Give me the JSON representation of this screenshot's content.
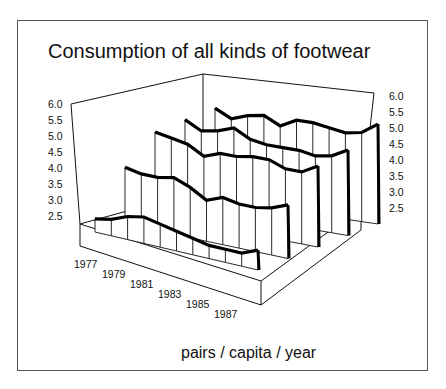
{
  "chart_data": {
    "type": "3d-ribbon-line",
    "title": "Consumption of all kinds of footwear",
    "xlabel": "",
    "ylabel": "pairs / capita / year",
    "y_tick_labels_left": [
      "6.0",
      "5.5",
      "5.0",
      "4.5",
      "4.0",
      "3.5",
      "3.0",
      "2.5"
    ],
    "y_tick_labels_right": [
      "6.0",
      "5.5",
      "5.0",
      "4.5",
      "4.0",
      "3.5",
      "3.0",
      "2.5"
    ],
    "ylim": [
      2.5,
      6.0
    ],
    "x_tick_labels": [
      "1977",
      "1979",
      "1981",
      "1983",
      "1985",
      "1987"
    ],
    "categories": [
      "1977",
      "1978",
      "1979",
      "1980",
      "1981",
      "1982",
      "1983",
      "1984",
      "1985",
      "1986",
      "1987"
    ],
    "series": [
      {
        "name": "series-1 (front)",
        "values": [
          2.6,
          2.7,
          2.9,
          3.0,
          2.9,
          2.8,
          2.7,
          2.6,
          2.6,
          2.6,
          2.8
        ]
      },
      {
        "name": "series-2",
        "values": [
          4.0,
          3.9,
          3.9,
          4.0,
          3.8,
          3.5,
          3.7,
          3.6,
          3.6,
          3.7,
          3.9
        ]
      },
      {
        "name": "series-3",
        "values": [
          5.0,
          4.9,
          4.8,
          4.5,
          4.7,
          4.7,
          4.8,
          4.8,
          4.6,
          4.6,
          4.9
        ]
      },
      {
        "name": "series-4",
        "values": [
          5.3,
          5.0,
          5.1,
          5.3,
          5.0,
          4.9,
          4.9,
          4.9,
          4.8,
          4.9,
          5.2
        ]
      },
      {
        "name": "series-5 (back)",
        "values": [
          5.6,
          5.3,
          5.5,
          5.6,
          5.3,
          5.6,
          5.6,
          5.5,
          5.4,
          5.5,
          5.9
        ]
      }
    ],
    "grid": false,
    "legend": "none"
  },
  "title": "Consumption of all kinds of footwear",
  "unit_label": "pairs / capita / year"
}
